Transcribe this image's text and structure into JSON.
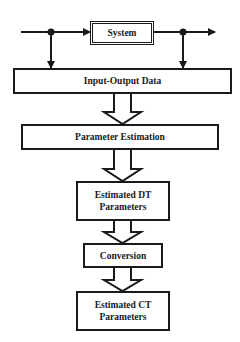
{
  "diagram": {
    "type": "flowchart",
    "colors": {
      "stroke": "#1a1a1a",
      "background": "#ffffff"
    },
    "nodes": {
      "system": {
        "label": "System"
      },
      "io_data": {
        "label": "Input-Output Data"
      },
      "param_est": {
        "label": "Parameter Estimation"
      },
      "dt_params": {
        "line1": "Estimated DT",
        "line2": "Parameters"
      },
      "conversion": {
        "label": "Conversion"
      },
      "ct_params": {
        "line1": "Estimated CT",
        "line2": "Parameters"
      }
    },
    "edges": [
      {
        "from": "input",
        "to": "system",
        "style": "line-arrow"
      },
      {
        "from": "system",
        "to": "output",
        "style": "line-arrow"
      },
      {
        "from": "input-tap",
        "to": "io_data",
        "style": "line-arrow"
      },
      {
        "from": "output-tap",
        "to": "io_data",
        "style": "line-arrow"
      },
      {
        "from": "io_data",
        "to": "param_est",
        "style": "hollow-arrow"
      },
      {
        "from": "param_est",
        "to": "dt_params",
        "style": "hollow-arrow"
      },
      {
        "from": "dt_params",
        "to": "conversion",
        "style": "hollow-arrow"
      },
      {
        "from": "conversion",
        "to": "ct_params",
        "style": "hollow-arrow"
      }
    ]
  }
}
